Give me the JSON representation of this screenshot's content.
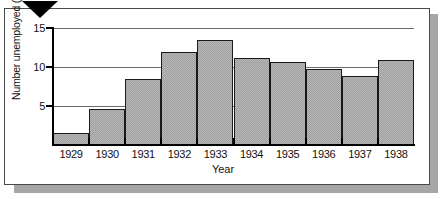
{
  "figure": {
    "marker_icon": "down-triangle-marker"
  },
  "chart_data": {
    "type": "bar",
    "title": "",
    "xlabel": "Year",
    "ylabel": "Number unemployed (millions)",
    "categories": [
      "1929",
      "1930",
      "1931",
      "1932",
      "1933",
      "1934",
      "1935",
      "1936",
      "1937",
      "1938"
    ],
    "values": [
      1.6,
      4.6,
      8.5,
      11.9,
      13.4,
      11.2,
      10.6,
      9.7,
      8.8,
      10.9
    ],
    "ylim": [
      0,
      15
    ],
    "yticks": [
      5,
      10,
      15
    ],
    "ytick_labels": [
      "5",
      "10",
      "15"
    ],
    "grid": true,
    "legend": false,
    "bar_fill_color": "#b9b9b9",
    "bar_edge_color": "#1a1a1a",
    "axis_color": "#000000",
    "gridline_color": "#6b6b6b"
  }
}
